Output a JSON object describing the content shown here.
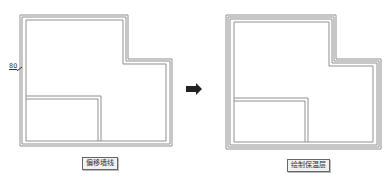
{
  "left_panel": {
    "caption": "偏移墙线",
    "dimension_label": "80"
  },
  "right_panel": {
    "caption": "绘制保温层"
  },
  "arrow": {
    "icon": "right-arrow-icon",
    "color": "#222222"
  },
  "colors": {
    "wall_line": "#8a8a8a",
    "background": "#ffffff"
  }
}
